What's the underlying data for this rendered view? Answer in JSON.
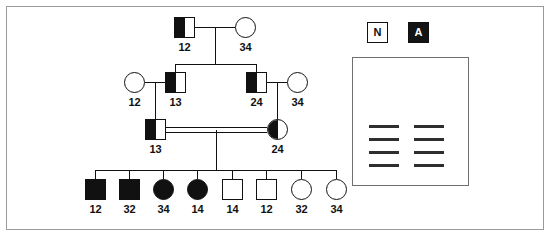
{
  "figure": {
    "border_color": "#9a9a9a",
    "symbol_color": "#111111",
    "background": "#ffffff"
  },
  "legend": {
    "normal": {
      "label": "N",
      "name": "normal-allele"
    },
    "affected": {
      "label": "A",
      "name": "affected-allele"
    }
  },
  "gel": {
    "lanes": 2,
    "band_rows": 4,
    "bands": [
      {
        "lane": "left",
        "row": 1
      },
      {
        "lane": "right",
        "row": 1
      },
      {
        "lane": "left",
        "row": 2
      },
      {
        "lane": "right",
        "row": 2
      },
      {
        "lane": "left",
        "row": 3
      },
      {
        "lane": "right",
        "row": 3
      },
      {
        "lane": "left",
        "row": 4
      },
      {
        "lane": "right",
        "row": 4
      }
    ]
  },
  "pedigree": {
    "generations": [
      {
        "id": "I",
        "individuals": [
          {
            "id": "I-1",
            "sex": "male",
            "shape": "square",
            "fill": "half-left",
            "haplotype": "12"
          },
          {
            "id": "I-2",
            "sex": "female",
            "shape": "circle",
            "fill": "open",
            "haplotype": "34"
          }
        ]
      },
      {
        "id": "II",
        "individuals": [
          {
            "id": "II-1",
            "sex": "female",
            "shape": "circle",
            "fill": "open",
            "haplotype": "12"
          },
          {
            "id": "II-2",
            "sex": "male",
            "shape": "square",
            "fill": "half-left",
            "haplotype": "13"
          },
          {
            "id": "II-3",
            "sex": "male",
            "shape": "square",
            "fill": "half-left",
            "haplotype": "24"
          },
          {
            "id": "II-4",
            "sex": "female",
            "shape": "circle",
            "fill": "open",
            "haplotype": "34"
          }
        ]
      },
      {
        "id": "III",
        "consanguineous": true,
        "individuals": [
          {
            "id": "III-1",
            "sex": "male",
            "shape": "square",
            "fill": "half-left",
            "haplotype": "13"
          },
          {
            "id": "III-2",
            "sex": "female",
            "shape": "circle",
            "fill": "half-left",
            "haplotype": "24"
          }
        ]
      },
      {
        "id": "IV",
        "individuals": [
          {
            "id": "IV-1",
            "sex": "male",
            "shape": "square",
            "fill": "filled",
            "haplotype": "12"
          },
          {
            "id": "IV-2",
            "sex": "male",
            "shape": "square",
            "fill": "filled",
            "haplotype": "32"
          },
          {
            "id": "IV-3",
            "sex": "female",
            "shape": "circle",
            "fill": "filled",
            "haplotype": "34"
          },
          {
            "id": "IV-4",
            "sex": "female",
            "shape": "circle",
            "fill": "filled",
            "haplotype": "14"
          },
          {
            "id": "IV-5",
            "sex": "male",
            "shape": "square",
            "fill": "open",
            "haplotype": "14"
          },
          {
            "id": "IV-6",
            "sex": "male",
            "shape": "square",
            "fill": "open",
            "haplotype": "12"
          },
          {
            "id": "IV-7",
            "sex": "female",
            "shape": "circle",
            "fill": "open",
            "haplotype": "32"
          },
          {
            "id": "IV-8",
            "sex": "female",
            "shape": "circle",
            "fill": "open",
            "haplotype": "34"
          }
        ]
      }
    ]
  }
}
